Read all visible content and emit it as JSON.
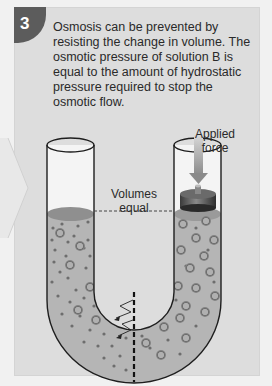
{
  "step": {
    "number": "3"
  },
  "caption": "Osmosis can be prevented by resisting the change in volume. The osmotic pressure of solution B is equal to the amount of hydrostatic pressure required to stop the osmotic flow.",
  "labels": {
    "applied_force": "Applied force",
    "volumes_equal": "Volumes equal"
  },
  "diagram": {
    "type": "U-tube osmosis apparatus",
    "left_arm": "solution with small solute particles, level equal",
    "right_arm": "solution B with large solute particles, piston/weight applied",
    "membrane": "semipermeable membrane (dashed line) at bottom of U-tube",
    "arrows": "water flow arrows crossing membrane right to left"
  },
  "colors": {
    "panel": "#dddddd",
    "badge": "#5c5c5c",
    "liquid": "#b5b5b5",
    "particle": "#7a7a7a"
  }
}
